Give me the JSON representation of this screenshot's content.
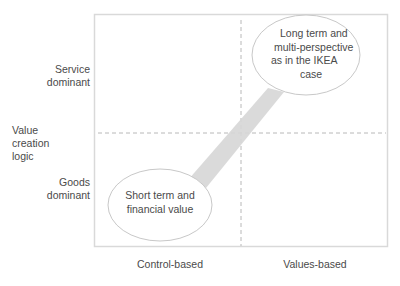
{
  "diagram": {
    "y_axis": {
      "title_lines": [
        "Value",
        "creation",
        "logic"
      ],
      "top_label_lines": [
        "Service",
        "dominant"
      ],
      "bottom_label_lines": [
        "Goods",
        "dominant"
      ]
    },
    "x_axis": {
      "left_label": "Control-based",
      "right_label": "Values-based"
    },
    "ellipses": [
      {
        "id": "upper-right",
        "lines": [
          "Long term and",
          "multi-perspective",
          "as in the IKEA",
          "case"
        ]
      },
      {
        "id": "lower-left",
        "lines": [
          "Short term and",
          "financial value"
        ]
      }
    ],
    "colors": {
      "frame": "#d9d9d9",
      "dashed": "#b8b8b8",
      "wedge": "#d6d6d6",
      "ellipse_stroke": "#c8c8c8",
      "text": "#4a4a4a"
    }
  }
}
